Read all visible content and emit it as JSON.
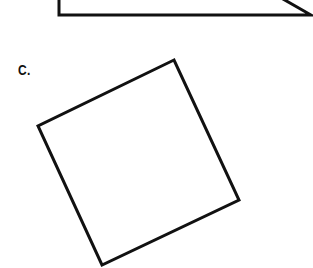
{
  "figure": {
    "label": "C.",
    "stroke_color": "#111111",
    "background": "#ffffff",
    "shapes": [
      {
        "name": "partial-trapezoid-top",
        "points": "59,-5 59,15 311,15 276,-5",
        "closed": false
      },
      {
        "name": "rotated-square",
        "points": "174,60 38,126 102,265 239,200",
        "closed": true
      }
    ]
  }
}
